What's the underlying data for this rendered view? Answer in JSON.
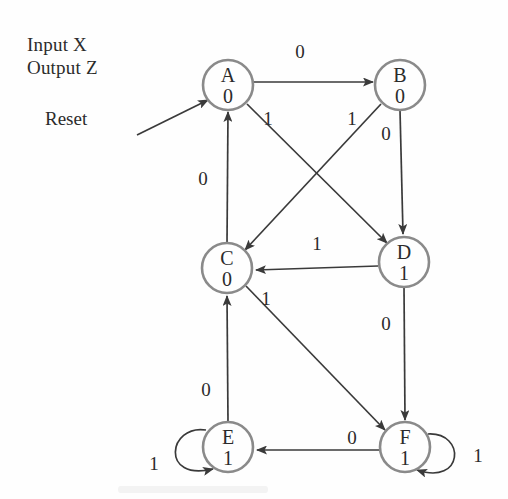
{
  "figure": {
    "kind": "mealy-moore-state-diagram",
    "legend": {
      "input_line": "Input X",
      "output_line": "Output Z"
    },
    "reset": {
      "label": "Reset",
      "target": "A"
    },
    "colors": {
      "node_stroke": "#8a8a8a",
      "edge_stroke": "#3a3a3a",
      "text": "#2b2b2b",
      "background": "#fefefe"
    },
    "states": [
      {
        "id": "A",
        "name": "A",
        "output": "0",
        "cx": 228,
        "cy": 85,
        "r": 25
      },
      {
        "id": "B",
        "name": "B",
        "output": "0",
        "cx": 400,
        "cy": 85,
        "r": 25
      },
      {
        "id": "C",
        "name": "C",
        "output": "0",
        "cx": 227,
        "cy": 268,
        "r": 25
      },
      {
        "id": "D",
        "name": "D",
        "output": "1",
        "cx": 404,
        "cy": 262,
        "r": 25
      },
      {
        "id": "E",
        "name": "E",
        "output": "1",
        "cx": 228,
        "cy": 447,
        "r": 25
      },
      {
        "id": "F",
        "name": "F",
        "output": "1",
        "cx": 405,
        "cy": 447,
        "r": 25
      }
    ],
    "transitions": [
      {
        "from": "A",
        "to": "B",
        "label": "0",
        "label_x": 300,
        "label_y": 58
      },
      {
        "from": "A",
        "to": "D",
        "label": "1",
        "label_x": 268,
        "label_y": 125
      },
      {
        "from": "B",
        "to": "C",
        "label": "1",
        "label_x": 352,
        "label_y": 125
      },
      {
        "from": "B",
        "to": "D",
        "label": "0",
        "label_x": 386,
        "label_y": 140
      },
      {
        "from": "C",
        "to": "A",
        "label": "0",
        "label_x": 203,
        "label_y": 185
      },
      {
        "from": "C",
        "to": "F",
        "label": "1",
        "label_x": 266,
        "label_y": 305
      },
      {
        "from": "D",
        "to": "C",
        "label": "1",
        "label_x": 317,
        "label_y": 250
      },
      {
        "from": "D",
        "to": "F",
        "label": "0",
        "label_x": 386,
        "label_y": 330
      },
      {
        "from": "E",
        "to": "C",
        "label": "0",
        "label_x": 206,
        "label_y": 396
      },
      {
        "from": "E",
        "to": "E",
        "label": "1",
        "label_x": 154,
        "label_y": 470,
        "self_loop": true
      },
      {
        "from": "F",
        "to": "E",
        "label": "0",
        "label_x": 352,
        "label_y": 444
      },
      {
        "from": "F",
        "to": "F",
        "label": "1",
        "label_x": 478,
        "label_y": 462,
        "self_loop": true
      }
    ]
  }
}
